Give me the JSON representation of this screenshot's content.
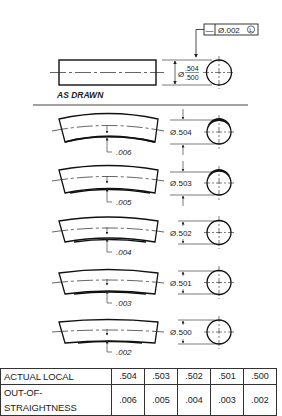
{
  "feature_control_frame": {
    "symbol": "—",
    "tolerance": "Ø.002",
    "modifier": "L"
  },
  "as_drawn": {
    "label": "AS DRAWN",
    "diameter_symbol": "Ø",
    "size_upper": ".504",
    "size_lower": ".500"
  },
  "examples": [
    {
      "diameter": "Ø.504",
      "straightness": ".006"
    },
    {
      "diameter": "Ø.503",
      "straightness": ".005"
    },
    {
      "diameter": "Ø.502",
      "straightness": ".004"
    },
    {
      "diameter": "Ø.501",
      "straightness": ".003"
    },
    {
      "diameter": "Ø.500",
      "straightness": ".002"
    }
  ],
  "table": {
    "rows": [
      {
        "header": "ACTUAL LOCAL",
        "values": [
          ".504",
          ".503",
          ".502",
          ".501",
          ".500"
        ]
      },
      {
        "header": "OUT-OF-STRAIGHTNESS",
        "values": [
          ".006",
          ".005",
          ".004",
          ".003",
          ".002"
        ]
      }
    ]
  }
}
